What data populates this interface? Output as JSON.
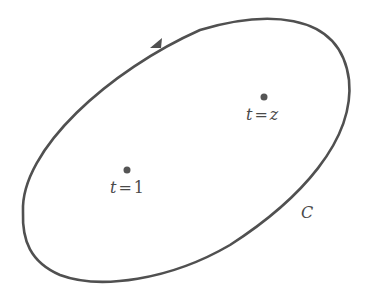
{
  "diagram": {
    "contour": {
      "label": "C",
      "stroke_color": "#505050",
      "direction": "counterclockwise"
    },
    "points": [
      {
        "id": "t1",
        "var": "t",
        "eq": "=",
        "value": "1",
        "fill": "#555555"
      },
      {
        "id": "tz",
        "var": "t",
        "eq": "=",
        "value": "z",
        "fill": "#555555"
      }
    ]
  }
}
